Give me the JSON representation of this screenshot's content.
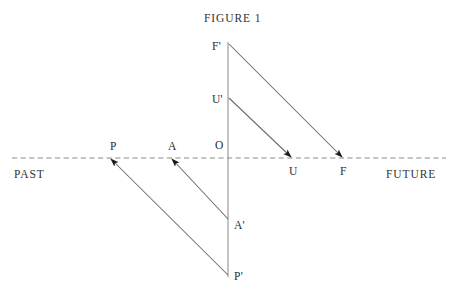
{
  "figure": {
    "title": "FIGURE 1",
    "axis": {
      "past_label": "PAST",
      "future_label": "FUTURE",
      "style": "dashed",
      "color": "#8c8c8c",
      "y": 158,
      "x_start": 12,
      "x_end": 446
    },
    "vertical_line": {
      "color": "#9a9a9a",
      "x": 228,
      "y_top": 42,
      "y_bottom": 277
    },
    "origin_label": "O",
    "points": [
      {
        "id": "F-prime",
        "label": "F'",
        "x": 213,
        "y": 42
      },
      {
        "id": "U-prime",
        "label": "U'",
        "x": 213,
        "y": 95
      },
      {
        "id": "O",
        "label": "O",
        "x": 215,
        "y": 140
      },
      {
        "id": "P",
        "label": "P",
        "x": 110,
        "y": 141
      },
      {
        "id": "A",
        "label": "A",
        "x": 168,
        "y": 141
      },
      {
        "id": "U",
        "label": "U",
        "x": 289,
        "y": 166
      },
      {
        "id": "F",
        "label": "F",
        "x": 340,
        "y": 166
      },
      {
        "id": "A-prime",
        "label": "A'",
        "x": 234,
        "y": 220
      },
      {
        "id": "P-prime",
        "label": "P'",
        "x": 234,
        "y": 271
      }
    ],
    "arrows": [
      {
        "id": "f-prime-to-f",
        "from": "F'",
        "to": "F",
        "x1": 229,
        "y1": 44,
        "x2": 342,
        "y2": 157,
        "color": "#6b6b6b"
      },
      {
        "id": "u-prime-to-u",
        "from": "U'",
        "to": "U",
        "x1": 229,
        "y1": 98,
        "x2": 291,
        "y2": 157,
        "color": "#6b6b6b"
      },
      {
        "id": "a-prime-to-a",
        "from": "A'",
        "to": "A",
        "x1": 228,
        "y1": 219,
        "x2": 172,
        "y2": 159,
        "color": "#6b6b6b"
      },
      {
        "id": "p-prime-to-p",
        "from": "P'",
        "to": "P",
        "x1": 228,
        "y1": 275,
        "x2": 111,
        "y2": 159,
        "color": "#6b6b6b"
      }
    ],
    "colors": {
      "ink": "#2b2b2b",
      "line": "#6b6b6b",
      "axis": "#8c8c8c",
      "background": "#ffffff"
    }
  }
}
